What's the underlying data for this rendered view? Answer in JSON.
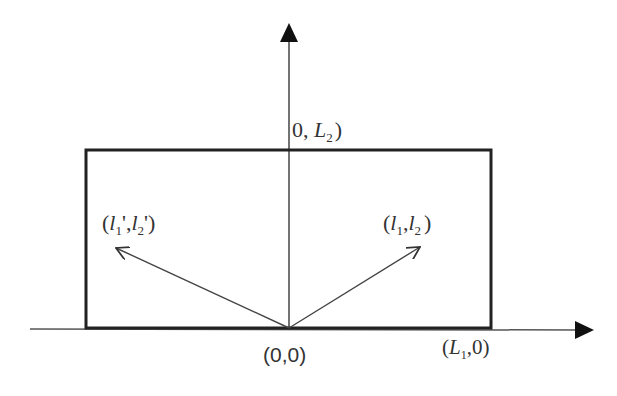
{
  "diagram": {
    "type": "coordinate-geometry",
    "colors": {
      "stroke": "#222222",
      "text": "#333333",
      "background": "#ffffff"
    },
    "axes": {
      "x_axis": {
        "direction": "right",
        "arrow": true
      },
      "y_axis": {
        "direction": "up",
        "arrow": true
      }
    },
    "rectangle": {
      "description": "box from (0,0) region spanning L1 wide and L2 tall"
    },
    "labels": {
      "origin": "(0,0)",
      "top_point_open": "0, ",
      "top_point_L": "L",
      "top_point_sub": "2",
      "top_point_close": ")",
      "corner_open": "(",
      "corner_L": "L",
      "corner_sub": "1",
      "corner_close": ",0)",
      "vec_right_open": "(",
      "vec_right_l1": "l",
      "vec_right_sub1": "1",
      "vec_right_mid": ",",
      "vec_right_l2": "l",
      "vec_right_sub2": "2",
      "vec_right_close": ")",
      "vec_left_open": "(",
      "vec_left_l1": "l",
      "vec_left_sub1": "1",
      "vec_left_mid": "',",
      "vec_left_l2": "l",
      "vec_left_sub2": "2",
      "vec_left_close": "')"
    },
    "vectors": [
      {
        "name": "vector-l1-l2",
        "from": "(0,0)",
        "to": "(l1,l2)"
      },
      {
        "name": "vector-l1prime-l2prime",
        "from": "(0,0)",
        "to": "(l1',l2')"
      }
    ]
  }
}
